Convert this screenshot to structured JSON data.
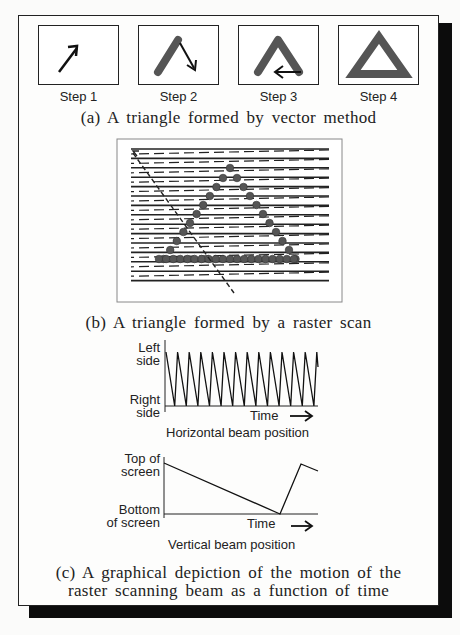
{
  "figure": {
    "part_a": {
      "steps": [
        {
          "label": "Step 1",
          "icon": "single-arrow-icon"
        },
        {
          "label": "Step 2",
          "icon": "two-stroke-arrow-icon"
        },
        {
          "label": "Step 3",
          "icon": "three-stroke-arrow-icon"
        },
        {
          "label": "Step 4",
          "icon": "complete-triangle-icon"
        }
      ],
      "caption": "(a) A triangle formed by vector method"
    },
    "part_b": {
      "caption": "(b) A triangle formed by a raster scan",
      "scan_lines": 15
    },
    "part_c": {
      "horizontal_chart": {
        "y_top_label_line1": "Left",
        "y_top_label_line2": "side",
        "y_bottom_label_line1": "Right",
        "y_bottom_label_line2": "side",
        "x_label": "Time",
        "arrow": "→",
        "title": "Horizontal beam position"
      },
      "vertical_chart": {
        "y_top_label_line1": "Top of",
        "y_top_label_line2": "screen",
        "y_bottom_label_line1": "Bottom",
        "y_bottom_label_line2": "of screen",
        "x_label": "Time",
        "arrow": "→",
        "title": "Vertical beam position"
      },
      "caption_line1": "(c) A graphical depiction of the motion of the",
      "caption_line2": "raster scanning beam as a function of time"
    }
  },
  "colors": {
    "stroke": "#1a1a1a",
    "triangle_fill": "#555555",
    "shadow": "#0c0c0c"
  }
}
